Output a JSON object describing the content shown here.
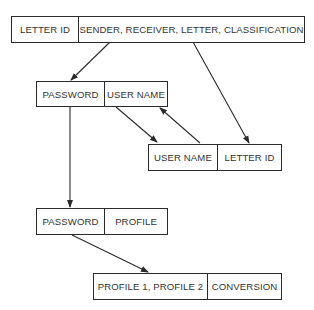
{
  "diagram": {
    "records": [
      {
        "id": "letter-record",
        "fields": [
          "LETTER ID",
          "SENDER, RECEIVER, LETTER, CLASSIFICATION"
        ]
      },
      {
        "id": "password-username-record",
        "fields": [
          "PASSWORD",
          "USER NAME"
        ]
      },
      {
        "id": "username-letterid-record",
        "fields": [
          "USER NAME",
          "LETTER ID"
        ]
      },
      {
        "id": "password-profile-record",
        "fields": [
          "PASSWORD",
          "PROFILE"
        ]
      },
      {
        "id": "profile-conversion-record",
        "fields": [
          "PROFILE 1, PROFILE 2",
          "CONVERSION"
        ]
      }
    ],
    "edges": [
      {
        "from": "letter-record",
        "to": "password-username-record"
      },
      {
        "from": "letter-record",
        "to": "username-letterid-record"
      },
      {
        "from": "password-username-record",
        "to": "username-letterid-record"
      },
      {
        "from": "username-letterid-record",
        "to": "password-username-record"
      },
      {
        "from": "password-username-record",
        "to": "password-profile-record"
      },
      {
        "from": "password-profile-record",
        "to": "profile-conversion-record"
      }
    ],
    "colors": {
      "line": "#2a2a2a",
      "text": "#333333",
      "background": "#ffffff"
    }
  }
}
